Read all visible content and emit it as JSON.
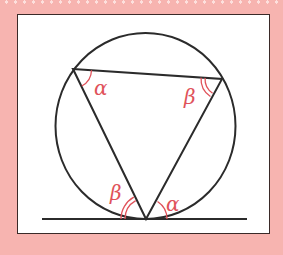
{
  "diagram": {
    "colors": {
      "background": "#f7b4b0",
      "panel": "#ffffff",
      "lines": "#2b2b2b",
      "angle_marks": "#e0525a"
    },
    "labels": {
      "top_left_angle": "α",
      "top_right_angle": "β",
      "bottom_left_angle": "β",
      "bottom_right_angle": "α"
    }
  }
}
